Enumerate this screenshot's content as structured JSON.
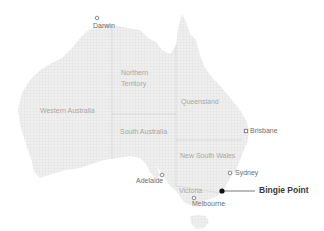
{
  "map": {
    "title": "Australia",
    "colors": {
      "land": "#ececec",
      "land_grid": "#dcdcdc",
      "border": "#cfcfcf",
      "state_label": "#a8a8a8",
      "city_label": "#6e6e6e",
      "poi": "#1a1a1a"
    },
    "states": [
      {
        "name": "Western Australia",
        "x": 40,
        "y": 107
      },
      {
        "name": "Northern",
        "x": 121,
        "y": 69
      },
      {
        "name": "Territory",
        "x": 121,
        "y": 80
      },
      {
        "name": "Queensland",
        "x": 181,
        "y": 98
      },
      {
        "name": "South Australia",
        "x": 120,
        "y": 128
      },
      {
        "name": "New South Wales",
        "x": 180,
        "y": 152
      },
      {
        "name": "Victoria",
        "x": 179,
        "y": 187
      }
    ],
    "cities": [
      {
        "name": "Darwin",
        "marker": [
          97,
          18
        ],
        "label_x": 93,
        "label_y": 22
      },
      {
        "name": "Brisbane",
        "marker": [
          246,
          131
        ],
        "label_x": 250,
        "label_y": 127
      },
      {
        "name": "Sydney",
        "marker": [
          230,
          173
        ],
        "label_x": 235,
        "label_y": 169
      },
      {
        "name": "Adelaide",
        "marker": [
          162,
          175
        ],
        "label_x": 136,
        "label_y": 177
      },
      {
        "name": "Melbourne",
        "marker": [
          194,
          198
        ],
        "label_x": 192,
        "label_y": 200
      }
    ],
    "highlight": {
      "name": "Bingie Point",
      "dot": [
        222,
        191
      ],
      "line_end": [
        255,
        191
      ],
      "label_x": 259,
      "label_y": 186
    }
  }
}
